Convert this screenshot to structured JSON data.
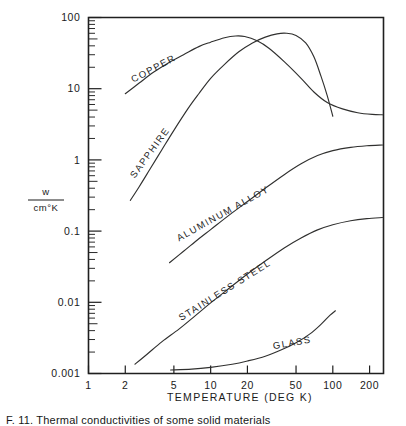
{
  "figure": {
    "caption_visible_fragment": "F. 11. Thermal conductivities of some solid materials",
    "background_color": "#ffffff",
    "ink_color": "#1f1f1f"
  },
  "axes": {
    "x": {
      "title": "TEMPERATURE  (DEG K)",
      "tick_labels": [
        "1",
        "2",
        "5",
        "10",
        "20",
        "50",
        "100",
        "200"
      ],
      "tick_values": [
        1,
        2,
        5,
        10,
        20,
        50,
        100,
        200
      ],
      "scale": "log",
      "range": [
        1,
        260
      ]
    },
    "y": {
      "title_numerator": "w",
      "title_denominator": "cm°K",
      "tick_labels": [
        "100",
        "10",
        "1",
        "0.1",
        "0.01",
        "0.001"
      ],
      "tick_values": [
        100,
        10,
        1,
        0.1,
        0.01,
        0.001
      ],
      "scale": "log",
      "range": [
        0.001,
        100
      ]
    }
  },
  "chart_data": {
    "type": "line",
    "title": "",
    "xlabel": "TEMPERATURE  (DEG K)",
    "ylabel": "w / cm°K",
    "xscale": "log",
    "yscale": "log",
    "xlim": [
      1,
      260
    ],
    "ylim": [
      0.001,
      100
    ],
    "grid": false,
    "legend": "inline-curve-labels",
    "series": [
      {
        "name": "COPPER",
        "label": "COPPER",
        "label_rotation_deg": -28,
        "points": [
          [
            2.0,
            8.5
          ],
          [
            2.6,
            12.0
          ],
          [
            3.4,
            17.0
          ],
          [
            4.5,
            23.0
          ],
          [
            6.0,
            30.0
          ],
          [
            8.0,
            39.0
          ],
          [
            10.0,
            45.0
          ],
          [
            13.0,
            52.0
          ],
          [
            16.0,
            55.0
          ],
          [
            19.0,
            54.0
          ],
          [
            24.0,
            47.0
          ],
          [
            30.0,
            37.0
          ],
          [
            40.0,
            24.0
          ],
          [
            55.0,
            14.0
          ],
          [
            70.0,
            9.0
          ],
          [
            90.0,
            6.4
          ],
          [
            120.0,
            5.2
          ],
          [
            160.0,
            4.6
          ],
          [
            210.0,
            4.35
          ],
          [
            255.0,
            4.3
          ]
        ]
      },
      {
        "name": "SAPPHIRE",
        "label": "SAPPHIRE",
        "label_rotation_deg": -54,
        "points": [
          [
            2.2,
            0.27
          ],
          [
            2.6,
            0.42
          ],
          [
            3.2,
            0.75
          ],
          [
            4.0,
            1.4
          ],
          [
            5.0,
            2.6
          ],
          [
            6.5,
            5.2
          ],
          [
            8.0,
            8.5
          ],
          [
            10.0,
            14.0
          ],
          [
            13.0,
            22.0
          ],
          [
            17.0,
            33.0
          ],
          [
            22.0,
            44.0
          ],
          [
            28.0,
            53.0
          ],
          [
            35.0,
            59.0
          ],
          [
            42.0,
            60.0
          ],
          [
            50.0,
            56.0
          ],
          [
            60.0,
            44.0
          ],
          [
            70.0,
            28.0
          ],
          [
            80.0,
            15.0
          ],
          [
            90.0,
            8.0
          ],
          [
            100.0,
            4.1
          ]
        ]
      },
      {
        "name": "ALUMINUM ALLOY",
        "label": "ALUMINUM  ALLOY",
        "label_rotation_deg": -29,
        "points": [
          [
            4.6,
            0.036
          ],
          [
            6.0,
            0.052
          ],
          [
            8.0,
            0.078
          ],
          [
            10.0,
            0.105
          ],
          [
            14.0,
            0.165
          ],
          [
            20.0,
            0.26
          ],
          [
            28.0,
            0.4
          ],
          [
            40.0,
            0.62
          ],
          [
            55.0,
            0.88
          ],
          [
            75.0,
            1.15
          ],
          [
            100.0,
            1.35
          ],
          [
            140.0,
            1.5
          ],
          [
            190.0,
            1.58
          ],
          [
            255.0,
            1.62
          ]
        ]
      },
      {
        "name": "STAINLESS STEEL",
        "label": "STAINLESS  STEEL",
        "label_rotation_deg": -32,
        "points": [
          [
            2.4,
            0.00135
          ],
          [
            3.0,
            0.00185
          ],
          [
            4.0,
            0.0028
          ],
          [
            5.5,
            0.0042
          ],
          [
            7.5,
            0.0065
          ],
          [
            10.0,
            0.0098
          ],
          [
            14.0,
            0.0155
          ],
          [
            20.0,
            0.025
          ],
          [
            28.0,
            0.038
          ],
          [
            40.0,
            0.058
          ],
          [
            55.0,
            0.08
          ],
          [
            75.0,
            0.104
          ],
          [
            100.0,
            0.123
          ],
          [
            140.0,
            0.14
          ],
          [
            190.0,
            0.15
          ],
          [
            255.0,
            0.155
          ]
        ]
      },
      {
        "name": "GLASS",
        "label": "GLASS",
        "label_rotation_deg": -10,
        "points": [
          [
            4.7,
            0.00112
          ],
          [
            7.0,
            0.00115
          ],
          [
            10.0,
            0.00122
          ],
          [
            15.0,
            0.00135
          ],
          [
            20.0,
            0.0015
          ],
          [
            28.0,
            0.00175
          ],
          [
            38.0,
            0.00215
          ],
          [
            50.0,
            0.0027
          ],
          [
            65.0,
            0.0036
          ],
          [
            80.0,
            0.0049
          ],
          [
            95.0,
            0.0066
          ],
          [
            105.0,
            0.0076
          ]
        ]
      }
    ]
  }
}
